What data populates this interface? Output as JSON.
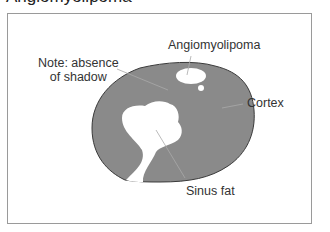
{
  "heading": "Angiomyolipoma",
  "labels": {
    "note_line1": "Note: absence",
    "note_line2": "of shadow",
    "angiomyolipoma": "Angiomyolipoma",
    "cortex": "Cortex",
    "sinus_fat": "Sinus fat"
  },
  "colors": {
    "cortex_fill": "#8a8a8a",
    "outline": "#3a3a3a",
    "fat_fill": "#ffffff",
    "leader_line": "#aaaaaa",
    "frame_border": "#9a9a9a"
  }
}
